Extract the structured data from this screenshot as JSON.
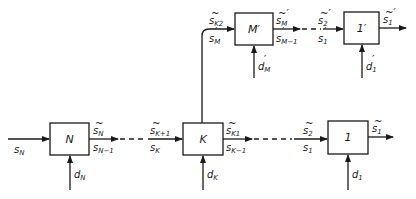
{
  "diagram": {
    "type": "serial-multistage-block-diagram-with-branch",
    "blocks": [
      {
        "id": "N",
        "label": "N",
        "input_state": "s_N",
        "decision": "d_N",
        "output_top": "s̃_N",
        "output_bottom": "s_{N−1}"
      },
      {
        "id": "K",
        "label": "K",
        "input_top": "s̃_{K+1}",
        "input_bottom": "s_K",
        "decision": "d_K",
        "output_top": "s̃_{K1}",
        "output_bottom": "s_{K−1}",
        "branch_output_top": "s̃_{K2}",
        "branch_output_bottom": "s′_M"
      },
      {
        "id": "Mp",
        "label": "M′",
        "input_top": "s̃_{K2}",
        "input_bottom": "s′_M",
        "decision": "d′_M",
        "output_top": "s̃′_M",
        "output_bottom": "s′_{M−1}"
      },
      {
        "id": "1p",
        "label": "1′",
        "input_top": "s̃′_2",
        "input_bottom": "s′_1",
        "decision": "d′_1",
        "output_top": "s̃′_1"
      },
      {
        "id": "1",
        "label": "1",
        "input_top": "s̃_2",
        "input_bottom": "s_1",
        "decision": "d_1",
        "output_top": "s̃_1"
      }
    ],
    "labels": {
      "N": "N",
      "K": "K",
      "Mp": "M′",
      "onep": "1′",
      "one": "1",
      "s": "s",
      "d": "d",
      "sub_N": "N",
      "sub_Nm1": "N−1",
      "sub_Kp1": "K+1",
      "sub_K": "K",
      "sub_K1": "K1",
      "sub_Km1": "K−1",
      "sub_K2": "K2",
      "sub_M": "M",
      "sub_Mm1": "M−1",
      "sub_2": "2",
      "sub_1": "1"
    }
  }
}
